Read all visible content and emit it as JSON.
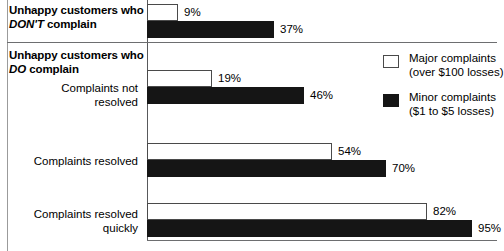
{
  "chart_data": {
    "type": "bar",
    "orientation": "horizontal",
    "title": "",
    "xlabel": "",
    "ylabel": "",
    "xlim": [
      0,
      100
    ],
    "grid": false,
    "legend_position": "top-right",
    "categories": [
      "Unhappy customers who DON'T complain",
      "Complaints not resolved",
      "Complaints resolved",
      "Complaints resolved quickly"
    ],
    "series": [
      {
        "name": "Major complaints (over $100 losses)",
        "color": "#ffffff",
        "values": [
          9,
          19,
          54,
          82
        ],
        "value_labels": [
          "9%",
          "19%",
          "54%",
          "82%"
        ]
      },
      {
        "name": "Minor complaints ($1 to $5 losses)",
        "color": "#151515",
        "values": [
          37,
          46,
          70,
          95
        ],
        "value_labels": [
          "37%",
          "46%",
          "70%",
          "95%"
        ]
      }
    ]
  },
  "sections": {
    "dont": {
      "prefix": "Unhappy customers who",
      "emphasis": "DON'T",
      "suffix": "complain"
    },
    "do": {
      "prefix": "Unhappy customers who",
      "emphasis": "DO",
      "suffix": "complain"
    }
  },
  "row_labels": {
    "not_resolved": "Complaints not resolved",
    "resolved": "Complaints resolved",
    "resolved_quickly": "Complaints resolved quickly"
  },
  "legend": {
    "items": [
      {
        "swatch": "major-swatch",
        "line1": "Major complaints",
        "line2": "(over $100 losses)"
      },
      {
        "swatch": "minor-swatch",
        "line1": "Minor complaints",
        "line2": "($1 to $5 losses)"
      }
    ]
  },
  "colors": {
    "major": "#ffffff",
    "minor": "#151515",
    "rule": "#6d6e70",
    "axis": "#58595b"
  }
}
